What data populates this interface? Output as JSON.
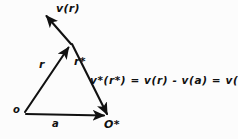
{
  "figure": {
    "style": {
      "stroke_color": "#111111",
      "background": "#fcfcfc",
      "text_color": "#101010"
    },
    "points": {
      "o": {
        "label": "o",
        "x": 25,
        "y": 112
      },
      "o_star": {
        "label": "O*",
        "x": 108,
        "y": 116
      },
      "apex": {
        "label": "",
        "x": 70,
        "y": 45
      },
      "v_tip": {
        "label": "",
        "x": 44,
        "y": 13
      }
    },
    "vectors": [
      {
        "name": "r",
        "label": "r",
        "from": "o",
        "to": "apex",
        "arrow": true
      },
      {
        "name": "r-star",
        "label": "r*",
        "from": "apex",
        "to": "o_star",
        "arrow": true
      },
      {
        "name": "a",
        "label": "a",
        "from": "o",
        "to": "o_star",
        "arrow": true
      },
      {
        "name": "v-of-r",
        "label": "v(r)",
        "from": "apex",
        "to": "v_tip",
        "arrow": true
      }
    ],
    "labels": {
      "v_of_r": "v(r)",
      "r": "r",
      "r_star": "r*",
      "origin": "o",
      "a": "a",
      "o_star": "O*"
    },
    "equation": "v*(r*) = v(r) - v(a) = v(r*)"
  }
}
